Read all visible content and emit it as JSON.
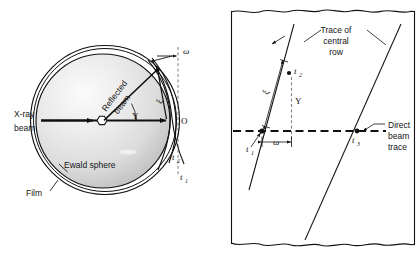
{
  "figure": {
    "panels": [
      {
        "id": "left",
        "name": "ewald-sphere-panel",
        "labels": {
          "xray_beam_line1": "X-ray",
          "xray_beam_line2": "beam",
          "reflected_beam_line1": "Reflected",
          "reflected_beam_line2": "beam",
          "ewald_sphere": "Ewald sphere",
          "film": "Film",
          "origin": "O",
          "omega": "ω",
          "xi": "ξ",
          "upsilon": "Υ",
          "t1": "t",
          "t1_sub": "1",
          "t2": "t",
          "t2_sub": "2"
        }
      },
      {
        "id": "right",
        "name": "film-trace-panel",
        "labels": {
          "trace_line1": "Trace of",
          "trace_line2": "central",
          "trace_line3": "row",
          "direct_line1": "Direct",
          "direct_line2": "beam",
          "direct_line3": "trace",
          "omega": "ω",
          "xi": "ξ",
          "upsilon": "Υ",
          "t1": "t",
          "t1_sub": "1",
          "t2": "t",
          "t2_sub": "2",
          "t3": "t",
          "t3_sub": "3"
        }
      }
    ],
    "colors": {
      "ink": "#111111",
      "dash": "#444444",
      "sphere_light": "#f2f2f2",
      "sphere_mid": "#d8d8d8",
      "sphere_dark": "#b8b8b8",
      "background": "#ffffff"
    }
  }
}
